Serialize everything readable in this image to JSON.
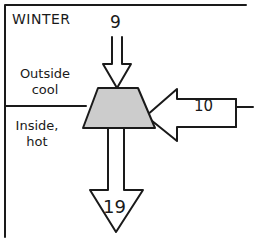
{
  "diagram": {
    "title": "WINTER",
    "zones": {
      "outside": {
        "line1": "Outside",
        "line2": "cool"
      },
      "inside": {
        "line1": "Inside,",
        "line2": "hot"
      }
    },
    "flows": {
      "input_top": {
        "value": "9",
        "direction": "down"
      },
      "input_right": {
        "value": "10",
        "direction": "left"
      },
      "output_bottom": {
        "value": "19",
        "direction": "down"
      }
    },
    "colors": {
      "ink": "#1a1a1a",
      "node_fill": "#cccccc",
      "background": "#ffffff"
    }
  }
}
